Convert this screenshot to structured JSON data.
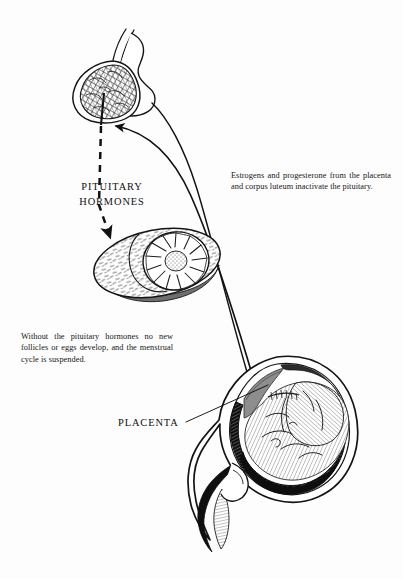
{
  "figure": {
    "background_color": "#fdfdfd",
    "ink_color": "#111111"
  },
  "labels": {
    "pituitary_hormones": "PITUITARY\nHORMONES",
    "pituitary_hormones_line1": "PITUITARY",
    "pituitary_hormones_line2": "HORMONES",
    "placenta": "PLACENTA"
  },
  "notes": {
    "estrogens": "Estrogens and progesterone from the placenta and corpus luteum inactivate the pituitary.",
    "follicles": "Without the pituitary hormones no new follicles or eggs develop, and the menstrual cycle is suspended."
  },
  "structures": [
    {
      "name": "pituitary-gland",
      "label": "Pituitary gland with stalk"
    },
    {
      "name": "ovary-corpus-luteum",
      "label": "Ovary containing corpus luteum"
    },
    {
      "name": "uterus-with-fetus",
      "label": "Gravid uterus with fetus and placenta"
    }
  ],
  "connectors": [
    {
      "name": "pituitary-to-ovary-dashed-arrow",
      "style": "dashed",
      "direction": "pituitary to ovary"
    },
    {
      "name": "uterus-to-pituitary-curve",
      "style": "solid-arrow",
      "direction": "uterus to pituitary"
    },
    {
      "name": "ovary-to-uterus-curve",
      "style": "solid",
      "direction": "ovary region to uterus"
    },
    {
      "name": "placenta-leader-line",
      "style": "solid-leader",
      "direction": "label to placenta"
    }
  ]
}
